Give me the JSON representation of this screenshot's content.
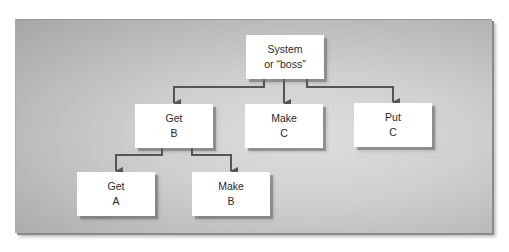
{
  "diagram": {
    "type": "hierarchy-chart",
    "colors": {
      "panel_center": "#dedede",
      "panel_edge": "#a6a6a6",
      "node_fill": "#ffffff",
      "connector": "#555555",
      "text": "#2a2a2a"
    },
    "nodes": [
      {
        "id": "system",
        "line1": "System",
        "line2": "or “boss”",
        "level": 0
      },
      {
        "id": "get-b",
        "line1": "Get",
        "line2": "B",
        "level": 1,
        "parent": "system"
      },
      {
        "id": "make-c",
        "line1": "Make",
        "line2": "C",
        "level": 1,
        "parent": "system"
      },
      {
        "id": "put-c",
        "line1": "Put",
        "line2": "C",
        "level": 1,
        "parent": "system"
      },
      {
        "id": "get-a",
        "line1": "Get",
        "line2": "A",
        "level": 2,
        "parent": "get-b"
      },
      {
        "id": "make-b",
        "line1": "Make",
        "line2": "B",
        "level": 2,
        "parent": "get-b"
      }
    ],
    "edges": [
      {
        "from": "system",
        "to": "get-b"
      },
      {
        "from": "system",
        "to": "make-c"
      },
      {
        "from": "system",
        "to": "put-c"
      },
      {
        "from": "get-b",
        "to": "get-a"
      },
      {
        "from": "get-b",
        "to": "make-b"
      }
    ]
  }
}
